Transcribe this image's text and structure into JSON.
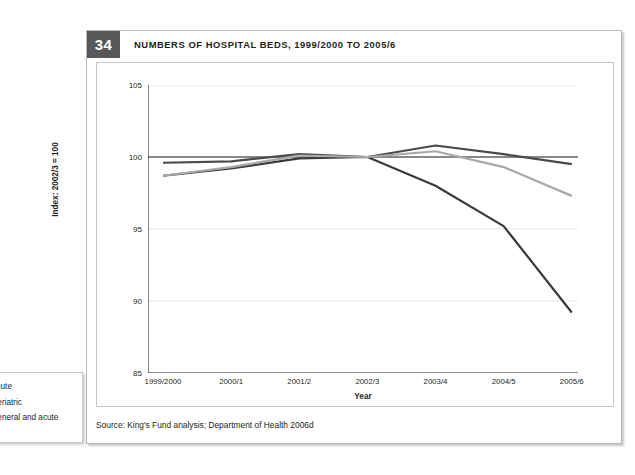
{
  "figure": {
    "number": "34",
    "title": "NUMBERS OF HOSPITAL BEDS, 1999/2000 TO 2005/6",
    "source": "Source: King's Fund analysis; Department of Health 2006d"
  },
  "chart_data": {
    "type": "line",
    "title": "NUMBERS OF HOSPITAL BEDS, 1999/2000 TO 2005/6",
    "xlabel": "Year",
    "ylabel": "Index: 2002/3 = 100",
    "categories": [
      "1999/2000",
      "2000/1",
      "2001/2",
      "2002/3",
      "2003/4",
      "2004/5",
      "2005/6"
    ],
    "ylim": [
      85,
      105
    ],
    "yticks": [
      85,
      90,
      95,
      100,
      105
    ],
    "grid": true,
    "legend_position": "bottom-left",
    "reference_line": 100,
    "series": [
      {
        "name": "Acute",
        "color": "#4a4a4c",
        "values": [
          99.6,
          99.7,
          100.2,
          100.0,
          100.8,
          100.2,
          99.5
        ]
      },
      {
        "name": "Geriatric",
        "color": "#3a3a3c",
        "values": [
          98.7,
          99.2,
          99.9,
          100.0,
          98.0,
          95.2,
          89.2
        ]
      },
      {
        "name": "General and acute",
        "color": "#a8a8aa",
        "values": [
          98.7,
          99.3,
          100.1,
          100.0,
          100.4,
          99.3,
          97.3
        ]
      }
    ]
  },
  "legend": {
    "items": [
      {
        "label": "Acute",
        "color": "#4a4a4c"
      },
      {
        "label": "Geriatric",
        "color": "#3a3a3c"
      },
      {
        "label": "General and acute",
        "color": "#a8a8aa"
      }
    ]
  }
}
